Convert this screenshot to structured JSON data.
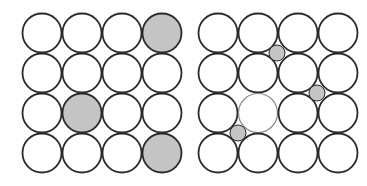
{
  "colors": {
    "background": "#ffffff",
    "outline": "#2b2b2b",
    "outline_light": "#8a8a8a",
    "atom_fill": "#ffffff",
    "impurity_fill": "#c4c4c4"
  },
  "lattices": [
    {
      "name": "substitutional-lattice",
      "origin": [
        42,
        33
      ],
      "pitch": 40,
      "radius": 19.5,
      "rows": 4,
      "cols": 4,
      "shaded_atoms": [
        [
          0,
          3
        ],
        [
          2,
          1
        ],
        [
          3,
          3
        ]
      ],
      "light_outline_atoms": [],
      "interstitials": []
    },
    {
      "name": "interstitial-lattice",
      "origin": [
        218,
        33
      ],
      "pitch": 40,
      "radius": 19.5,
      "rows": 4,
      "cols": 4,
      "shaded_atoms": [],
      "light_outline_atoms": [
        [
          2,
          1
        ]
      ],
      "interstitials": [
        {
          "cx": 277,
          "cy": 53,
          "r": 8
        },
        {
          "cx": 317,
          "cy": 93,
          "r": 8
        },
        {
          "cx": 238,
          "cy": 133,
          "r": 8
        }
      ]
    }
  ]
}
